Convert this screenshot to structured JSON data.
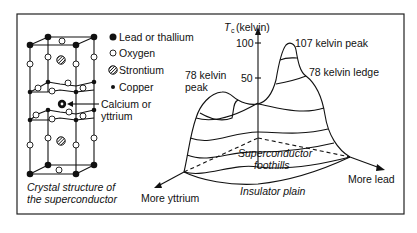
{
  "legend": {
    "items": [
      {
        "symbol": "filled-large-circle",
        "label": "Lead or thallium"
      },
      {
        "symbol": "open-circle",
        "label": "Oxygen"
      },
      {
        "symbol": "hatched-circle",
        "label": "Strontium"
      },
      {
        "symbol": "filled-small-circle",
        "label": "Copper"
      }
    ],
    "pointer_label_line1": "Calcium or",
    "pointer_label_line2": "yttrium"
  },
  "crystal": {
    "caption_line1": "Crystal structure of",
    "caption_line2": "the superconductor"
  },
  "landscape": {
    "axis_label_T": "T",
    "axis_label_sub": "c",
    "axis_label_unit": "(kelvin)",
    "ticks": [
      "100",
      "50"
    ],
    "annotations": {
      "peak_107": "107 kelvin peak",
      "ledge_78": "78 kelvin ledge",
      "peak_78_line1": "78 kelvin",
      "peak_78_line2": "peak",
      "foothills_line1": "Superconductor",
      "foothills_line2": "foothills",
      "plain": "Insulator plain"
    },
    "directions": {
      "yttrium": "More yttrium",
      "lead": "More lead"
    }
  },
  "colors": {
    "ink": "#111111",
    "background": "#ffffff"
  }
}
